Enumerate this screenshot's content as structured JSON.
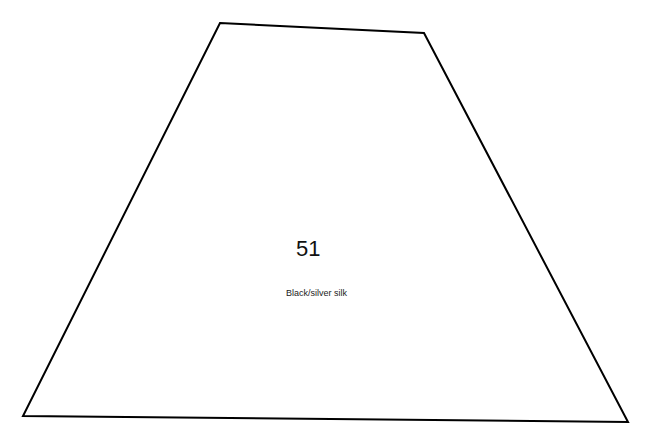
{
  "diagram": {
    "shape": "trapezoid",
    "vertices": [
      [
        220,
        23
      ],
      [
        424,
        33
      ],
      [
        628,
        422
      ],
      [
        23,
        416
      ]
    ],
    "stroke_color": "#000000",
    "fill_color": "#ffffff",
    "number": "51",
    "label": "Black/silver silk"
  }
}
